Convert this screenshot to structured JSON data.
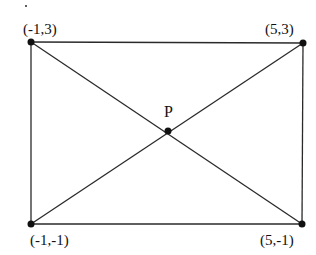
{
  "diagram": {
    "type": "rectangle-with-diagonals",
    "vertices": [
      {
        "id": "top-left",
        "label": "(-1,3)",
        "x": -1,
        "y": 3
      },
      {
        "id": "top-right",
        "label": "(5,3)",
        "x": 5,
        "y": 3
      },
      {
        "id": "bottom-left",
        "label": "(-1,-1)",
        "x": -1,
        "y": -1
      },
      {
        "id": "bottom-right",
        "label": "(5,-1)",
        "x": 5,
        "y": -1
      }
    ],
    "intersection": {
      "id": "P",
      "label": "P"
    },
    "edges": [
      "top",
      "bottom",
      "left",
      "right",
      "diagonal-tl-br",
      "diagonal-bl-tr"
    ],
    "colors": {
      "line": "#2a2a2a",
      "point": "#111111",
      "background": "#ffffff"
    }
  }
}
